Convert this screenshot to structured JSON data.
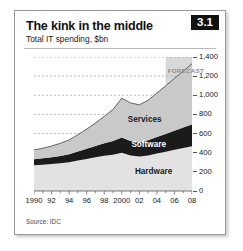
{
  "figure": {
    "title": "The kink in the middle",
    "subtitle": "Total IT spending, $bn",
    "badge": "3.1",
    "source": "Source: IDC"
  },
  "chart_data": {
    "type": "area",
    "stacked": true,
    "title": "The kink in the middle",
    "subtitle": "Total IT spending, $bn",
    "xlabel": "",
    "ylabel": "$bn",
    "grid": true,
    "legend_position": "inline-band-labels",
    "xlim": [
      1990,
      2008
    ],
    "ylim": [
      0,
      1400
    ],
    "yticks": [
      0,
      200,
      400,
      600,
      800,
      1000,
      1200,
      1400
    ],
    "ytick_labels": [
      "0",
      "200",
      "400",
      "600",
      "800",
      "1,000",
      "1,200",
      "1,400"
    ],
    "xticks": [
      1990,
      1992,
      1994,
      1996,
      1998,
      2000,
      2002,
      2004,
      2006,
      2008
    ],
    "xtick_labels": [
      "1990",
      "92",
      "94",
      "96",
      "98",
      "2000",
      "02",
      "04",
      "06",
      "08"
    ],
    "x": [
      1990,
      1991,
      1992,
      1993,
      1994,
      1995,
      1996,
      1997,
      1998,
      1999,
      2000,
      2001,
      2002,
      2003,
      2004,
      2005,
      2006,
      2007,
      2008
    ],
    "series": [
      {
        "name": "Hardware",
        "color": "#e2e2e2",
        "label_color": "#1a1a1a",
        "values": [
          270,
          275,
          282,
          290,
          300,
          318,
          335,
          352,
          368,
          380,
          400,
          372,
          360,
          372,
          392,
          410,
          430,
          450,
          468
        ]
      },
      {
        "name": "Software",
        "color": "#1b1b1b",
        "label_color": "#ffffff",
        "values": [
          62,
          66,
          70,
          76,
          84,
          94,
          106,
          118,
          130,
          142,
          158,
          150,
          148,
          158,
          172,
          186,
          200,
          214,
          228
        ]
      },
      {
        "name": "Services",
        "color": "#c9c9c9",
        "label_color": "#1a1a1a",
        "values": [
          98,
          105,
          118,
          132,
          150,
          176,
          206,
          240,
          282,
          330,
          412,
          398,
          392,
          418,
          460,
          502,
          546,
          590,
          634
        ]
      }
    ],
    "totals": [
      430,
      446,
      470,
      498,
      534,
      588,
      647,
      710,
      780,
      852,
      970,
      920,
      900,
      948,
      1024,
      1098,
      1176,
      1254,
      1330
    ],
    "annotations": [
      {
        "text": "FORECAST",
        "x_start": 2005,
        "x_end": 2008,
        "shaded": true,
        "shade_color": "#d8d8d8"
      }
    ]
  }
}
